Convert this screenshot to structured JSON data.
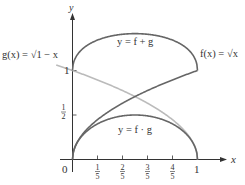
{
  "chart_data": {
    "type": "line",
    "title": "",
    "xlabel": "x",
    "ylabel": "y",
    "xlim": [
      0,
      1
    ],
    "ylim": [
      0,
      1.414
    ],
    "grid": false,
    "legend": "none (inline curve labels)",
    "x_ticks": [
      {
        "value": 0,
        "label": "0"
      },
      {
        "value": 0.2,
        "num": "1",
        "den": "5"
      },
      {
        "value": 0.4,
        "num": "2",
        "den": "5"
      },
      {
        "value": 0.6,
        "num": "3",
        "den": "5"
      },
      {
        "value": 0.8,
        "num": "4",
        "den": "5"
      },
      {
        "value": 1,
        "label": "1"
      }
    ],
    "y_ticks": [
      {
        "value": 0.5,
        "num": "1",
        "den": "2"
      },
      {
        "value": 1,
        "label": "1"
      }
    ],
    "series": [
      {
        "name": "f(x) = √x",
        "formula": "sqrt(x)",
        "color": "#666666",
        "x": [
          0,
          0.2,
          0.4,
          0.6,
          0.8,
          1.0
        ],
        "values": [
          0,
          0.447,
          0.632,
          0.775,
          0.894,
          1.0
        ]
      },
      {
        "name": "g(x) = √(1 − x)",
        "formula": "sqrt(1-x)",
        "color": "#bbbbbb",
        "x": [
          0,
          0.2,
          0.4,
          0.6,
          0.8,
          1.0
        ],
        "values": [
          1.0,
          0.894,
          0.775,
          0.632,
          0.447,
          0
        ]
      },
      {
        "name": "y = f + g",
        "formula": "sqrt(x)+sqrt(1-x)",
        "color": "#666666",
        "x": [
          0,
          0.2,
          0.4,
          0.5,
          0.6,
          0.8,
          1.0
        ],
        "values": [
          1.0,
          1.342,
          1.407,
          1.414,
          1.407,
          1.342,
          1.0
        ]
      },
      {
        "name": "y = f · g",
        "formula": "sqrt(x*(1-x))",
        "color": "#666666",
        "x": [
          0,
          0.2,
          0.4,
          0.5,
          0.6,
          0.8,
          1.0
        ],
        "values": [
          0,
          0.4,
          0.49,
          0.5,
          0.49,
          0.4,
          0
        ]
      }
    ],
    "annotations": {
      "g_label": "g(x) = √1 − x",
      "f_label": "f(x) = √x",
      "sum_label": "y = f + g",
      "prod_label": "y = f · g"
    }
  },
  "axes": {
    "x_label": "x",
    "y_label": "y",
    "origin_label": "0",
    "x_one_label": "1",
    "y_one_label": "1"
  },
  "colors": {
    "axis": "#333333",
    "dark_curve": "#666666",
    "light_curve": "#bbbbbb"
  }
}
